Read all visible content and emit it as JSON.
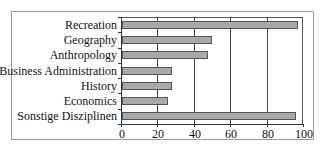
{
  "chart_data": {
    "type": "bar",
    "orientation": "horizontal",
    "title": "",
    "xlabel": "",
    "ylabel": "",
    "categories": [
      "Recreation",
      "Geography",
      "Anthropology",
      "Business Administration",
      "History",
      "Economics",
      "Sonstige Disziplinen"
    ],
    "values": [
      97,
      50,
      48,
      28,
      28,
      26,
      96
    ],
    "xlim": [
      0,
      100
    ],
    "xticks": [
      "0",
      "20",
      "40",
      "60",
      "80",
      "100"
    ],
    "grid": "vertical lines at 20, 40, 60, 80",
    "legend": null,
    "bar_color": "#a9a9a9"
  }
}
